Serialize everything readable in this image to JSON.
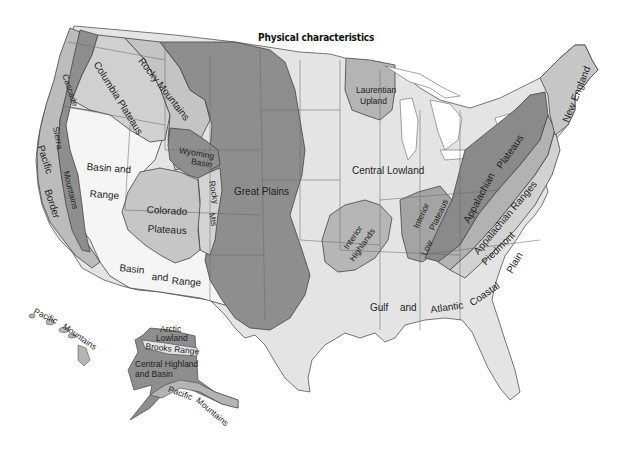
{
  "title": "Physical characteristics",
  "colors": {
    "background": "#ffffff",
    "dark_region": "#8e8e8e",
    "mid_region": "#b4b4b4",
    "light_region": "#d0d0d0",
    "pale_region": "#e4e4e4",
    "basin_range": "#f4f4f4",
    "border": "#444444"
  },
  "regions": {
    "cascade": "Cascade",
    "sierra": "Sierra",
    "mountains": "Mountains",
    "pacific": "Pacific",
    "border": "Border",
    "columbia_plateaus": "Columbia Plateaus",
    "rocky_mountains": "Rocky Mountains",
    "wyoming": "Wyoming",
    "basin": "Basin",
    "basin_and": "Basin and",
    "range": "Range",
    "colorado": "Colorado",
    "plateaus": "Plateaus",
    "rocky": "Rocky",
    "mts": "Mts",
    "great_plains": "Great Plains",
    "basin2": "Basin",
    "and2": "and",
    "range2": "Range",
    "laurentian": "Laurentian",
    "upland": "Upland",
    "central_lowland": "Central Lowland",
    "interior_h": "Interior",
    "highlands": "Highlands",
    "interior_l": "Interior",
    "low": "Low",
    "plateaus_l": "Plateaus",
    "appalachian_p": "Appalachian",
    "plateaus_a": "Plateaus",
    "appalachian_ranges": "Appalachian Ranges",
    "piedmont": "Piedmont",
    "new_england": "New England",
    "gulf": "Gulf",
    "and3": "and",
    "atlantic": "Atlantic",
    "coastal": "Coastal",
    "plain": "Plain",
    "hi_pacific": "Pacific",
    "hi_mountains": "Mountains",
    "ak_arctic": "Arctic",
    "ak_lowland": "Lowland",
    "ak_brooks": "Brooks Range",
    "ak_central": "Central Highland",
    "ak_basin": "and Basin",
    "ak_pacific": "Pacific",
    "ak_mountains": "Mountains"
  }
}
